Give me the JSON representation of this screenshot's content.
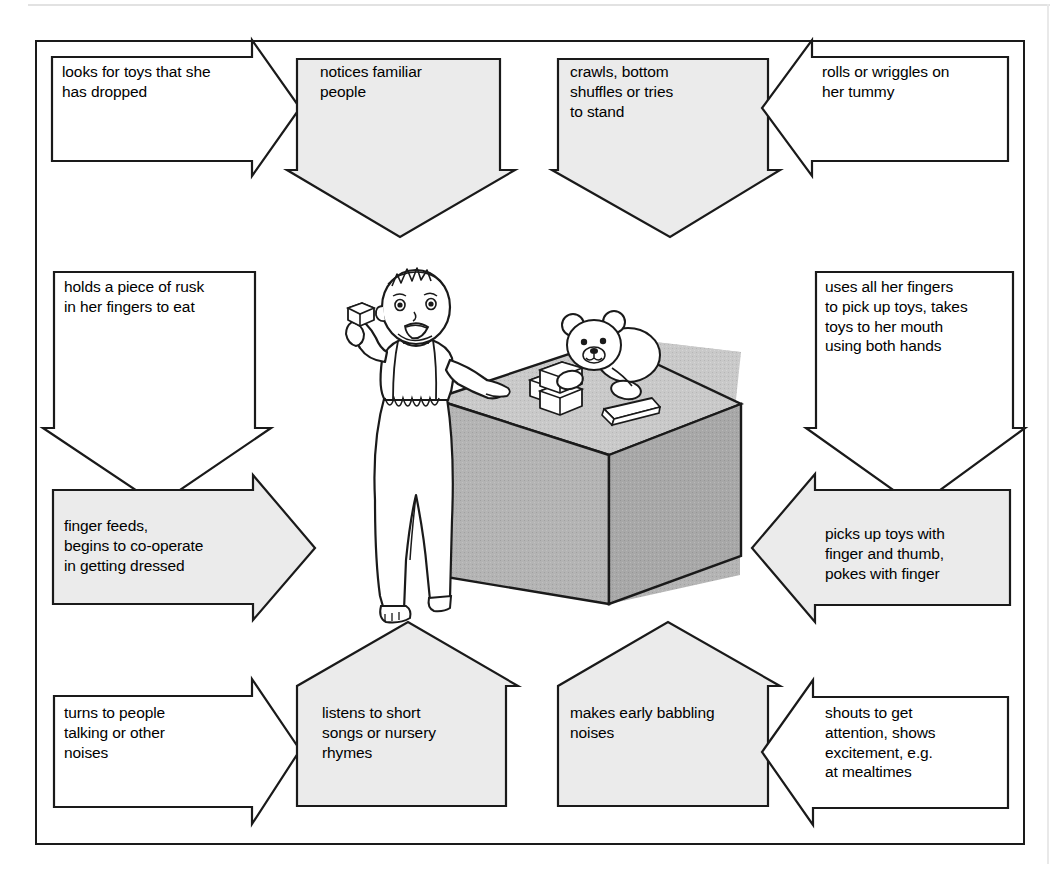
{
  "figure": {
    "caption_visible": false,
    "border_color": "#1a1a1a",
    "shaded_arrow_fill": "#ebebeb",
    "plain_arrow_fill": "#ffffff",
    "stroke_color": "#1a1a1a",
    "page_background": "#ffffff"
  },
  "illustration": {
    "name": "baby-standing-at-table-illustration",
    "description": "Line-drawn baby standing beside a grey cube table with building blocks and a teddy bear on top",
    "table_front_fill": "#b4b4b4",
    "table_top_fill": "#c9c9c9",
    "table_side_fill": "#a8a8a8",
    "elements": [
      "baby",
      "block-in-hand",
      "cube-table",
      "building-blocks",
      "teddy-bear",
      "book"
    ]
  },
  "arrows": [
    {
      "id": "looks-for-toys",
      "text": "looks for toys that she\nhas dropped",
      "direction": "right",
      "fill": "plain",
      "position": "top-left"
    },
    {
      "id": "notices-familiar-people",
      "text": "notices familiar\npeople",
      "direction": "down",
      "fill": "shaded",
      "position": "top-left-center"
    },
    {
      "id": "crawls-bottom-shuffles",
      "text": "crawls, bottom\nshuffles or tries\nto stand",
      "direction": "down",
      "fill": "shaded",
      "position": "top-right-center"
    },
    {
      "id": "rolls-or-wriggles",
      "text": "rolls or wriggles on\nher tummy",
      "direction": "left",
      "fill": "plain",
      "position": "top-right"
    },
    {
      "id": "holds-piece-of-rusk",
      "text": "holds a piece of rusk\nin her fingers to eat",
      "direction": "down",
      "fill": "plain",
      "position": "middle-left-upper"
    },
    {
      "id": "finger-feeds",
      "text": "finger feeds,\nbegins to co-operate\nin getting dressed",
      "direction": "right",
      "fill": "shaded",
      "position": "middle-left-lower"
    },
    {
      "id": "uses-all-her-fingers",
      "text": "uses all her fingers\nto pick up toys, takes\ntoys to her mouth\nusing both hands",
      "direction": "down",
      "fill": "plain",
      "position": "middle-right-upper"
    },
    {
      "id": "picks-up-toys",
      "text": "picks up toys with\nfinger and thumb,\npokes with finger",
      "direction": "left",
      "fill": "shaded",
      "position": "middle-right-lower"
    },
    {
      "id": "turns-to-people-talking",
      "text": "turns to people\ntalking or other\nnoises",
      "direction": "right",
      "fill": "plain",
      "position": "bottom-left"
    },
    {
      "id": "listens-to-short-songs",
      "text": "listens to short\nsongs or nursery\nrhymes",
      "direction": "up",
      "fill": "shaded",
      "position": "bottom-left-center"
    },
    {
      "id": "makes-early-babbling",
      "text": "makes early babbling\nnoises",
      "direction": "up",
      "fill": "shaded",
      "position": "bottom-right-center"
    },
    {
      "id": "shouts-to-get-attention",
      "text": "shouts to get\nattention, shows\nexcitement, e.g.\nat mealtimes",
      "direction": "left",
      "fill": "plain",
      "position": "bottom-right"
    }
  ]
}
